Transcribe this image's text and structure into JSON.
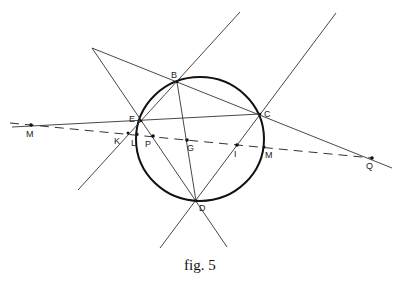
{
  "figure": {
    "caption": "fig. 5",
    "circle_label": "circumcircle",
    "points": [
      {
        "id": "B",
        "label": "B"
      },
      {
        "id": "C",
        "label": "C"
      },
      {
        "id": "E",
        "label": "E"
      },
      {
        "id": "D",
        "label": "D"
      },
      {
        "id": "M1",
        "label": "M"
      },
      {
        "id": "K",
        "label": "K"
      },
      {
        "id": "L",
        "label": "L"
      },
      {
        "id": "P",
        "label": "P"
      },
      {
        "id": "G",
        "label": "G"
      },
      {
        "id": "I",
        "label": "I"
      },
      {
        "id": "M2",
        "label": "M"
      },
      {
        "id": "Q",
        "label": "Q"
      }
    ],
    "line_style": {
      "solid_color": "#333333",
      "circle_color": "#111111",
      "dashed_line": "M–K–L–P–G–I–M–Q"
    }
  }
}
